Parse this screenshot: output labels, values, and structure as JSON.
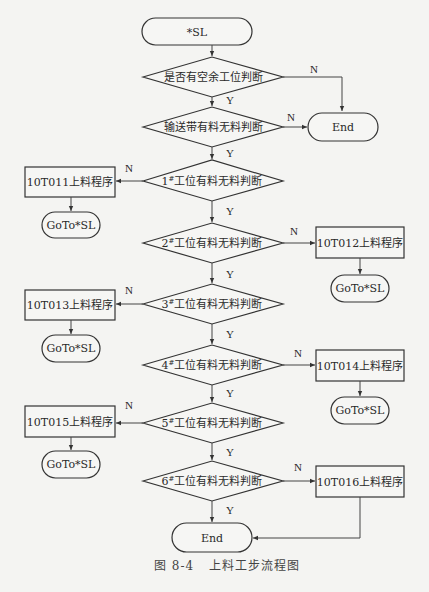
{
  "diagram": {
    "caption": "图 8-4   上料工步流程图",
    "start": "*SL",
    "end_label": "End",
    "goto_label": "GoTo*SL",
    "yes_label": "Y",
    "no_label": "N",
    "decisions": [
      {
        "id": "d1",
        "text": "是否有空余工位判断",
        "no_target": "End"
      },
      {
        "id": "d2",
        "text": "输送带有料无料判断",
        "no_target": "End"
      },
      {
        "id": "d3",
        "station": "1",
        "sup": "#",
        "text": "工位有料无料判断",
        "no_process": "10T011上料程序",
        "side": "left"
      },
      {
        "id": "d4",
        "station": "2",
        "sup": "#",
        "text": "工位有料无料判断",
        "no_process": "10T012上料程序",
        "side": "right"
      },
      {
        "id": "d5",
        "station": "3",
        "sup": "#",
        "text": "工位有料无料判断",
        "no_process": "10T013上料程序",
        "side": "left"
      },
      {
        "id": "d6",
        "station": "4",
        "sup": "#",
        "text": "工位有料无料判断",
        "no_process": "10T014上料程序",
        "side": "right"
      },
      {
        "id": "d7",
        "station": "5",
        "sup": "#",
        "text": "工位有料无料判断",
        "no_process": "10T015上料程序",
        "side": "left"
      },
      {
        "id": "d8",
        "station": "6",
        "sup": "#",
        "text": "工位有料无料判断",
        "no_process": "10T016上料程序",
        "side": "right",
        "process_next": "End"
      }
    ]
  }
}
